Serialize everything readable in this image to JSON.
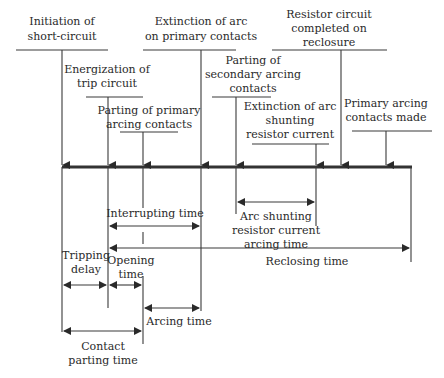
{
  "diagram": {
    "colors": {
      "line": "#3a3a3a",
      "text": "#2a2a2a",
      "background": "#ffffff"
    },
    "events": [
      {
        "id": "A",
        "lines": [
          "Initiation of",
          "short-circuit"
        ]
      },
      {
        "id": "B",
        "lines": [
          "Energization of",
          "trip circuit"
        ]
      },
      {
        "id": "C",
        "lines": [
          "Parting of primary",
          "arcing contacts"
        ]
      },
      {
        "id": "D",
        "lines": [
          "Extinction of arc",
          "on primary contacts"
        ]
      },
      {
        "id": "E",
        "lines": [
          "Parting of",
          "secondary arcing",
          "contacts"
        ]
      },
      {
        "id": "F",
        "lines": [
          "Extinction of arc",
          "shunting",
          "resistor current"
        ]
      },
      {
        "id": "G",
        "lines": [
          "Resistor circuit",
          "completed on",
          "reclosure"
        ]
      },
      {
        "id": "H",
        "lines": [
          "Primary arcing",
          "contacts made"
        ]
      }
    ],
    "intervals": [
      {
        "id": "interrupting",
        "lines": [
          "Interrupting time"
        ],
        "from": "B",
        "to": "D"
      },
      {
        "id": "reclosing",
        "lines": [
          "Reclosing time"
        ],
        "from": "B",
        "to": "end"
      },
      {
        "id": "arc-shunting",
        "lines": [
          "Arc shunting",
          "resistor current",
          "arcing time"
        ],
        "from": "E",
        "to": "F"
      },
      {
        "id": "tripping-delay",
        "lines": [
          "Tripping",
          "delay"
        ],
        "from": "A",
        "to": "B"
      },
      {
        "id": "opening",
        "lines": [
          "Opening",
          "time"
        ],
        "from": "B",
        "to": "C"
      },
      {
        "id": "arcing",
        "lines": [
          "Arcing time"
        ],
        "from": "C",
        "to": "D"
      },
      {
        "id": "contact-parting",
        "lines": [
          "Contact",
          "parting time"
        ],
        "from": "A",
        "to": "C"
      }
    ]
  }
}
